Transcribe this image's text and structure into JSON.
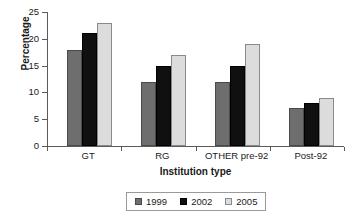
{
  "chart_data": {
    "type": "bar",
    "title": "",
    "xlabel": "Institution type",
    "ylabel": "Percentage",
    "categories": [
      "GT",
      "RG",
      "OTHER pre-92",
      "Post-92"
    ],
    "series": [
      {
        "name": "1999",
        "color": "#6e6e6e",
        "values": [
          18,
          12,
          12,
          7
        ]
      },
      {
        "name": "2002",
        "color": "#101010",
        "values": [
          21,
          15,
          15,
          8
        ]
      },
      {
        "name": "2005",
        "color": "#dcdcdc",
        "values": [
          23,
          17,
          19,
          9
        ]
      }
    ],
    "ylim": [
      0,
      25
    ],
    "ytick_labels": [
      "0",
      "5",
      "10",
      "15",
      "20",
      "25"
    ],
    "ytick_values": [
      0,
      5,
      10,
      15,
      20,
      25
    ],
    "grid": false,
    "legend_position": "bottom"
  }
}
